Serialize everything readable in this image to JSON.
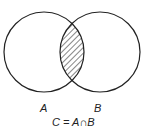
{
  "diagram": {
    "type": "venn",
    "sets": [
      {
        "name": "A",
        "label": "A"
      },
      {
        "name": "B",
        "label": "B"
      }
    ],
    "highlighted_region": "intersection",
    "caption": "C = A∩B",
    "colors": {
      "stroke": "#222222",
      "background": "#ffffff",
      "hatch": "#222222"
    }
  }
}
